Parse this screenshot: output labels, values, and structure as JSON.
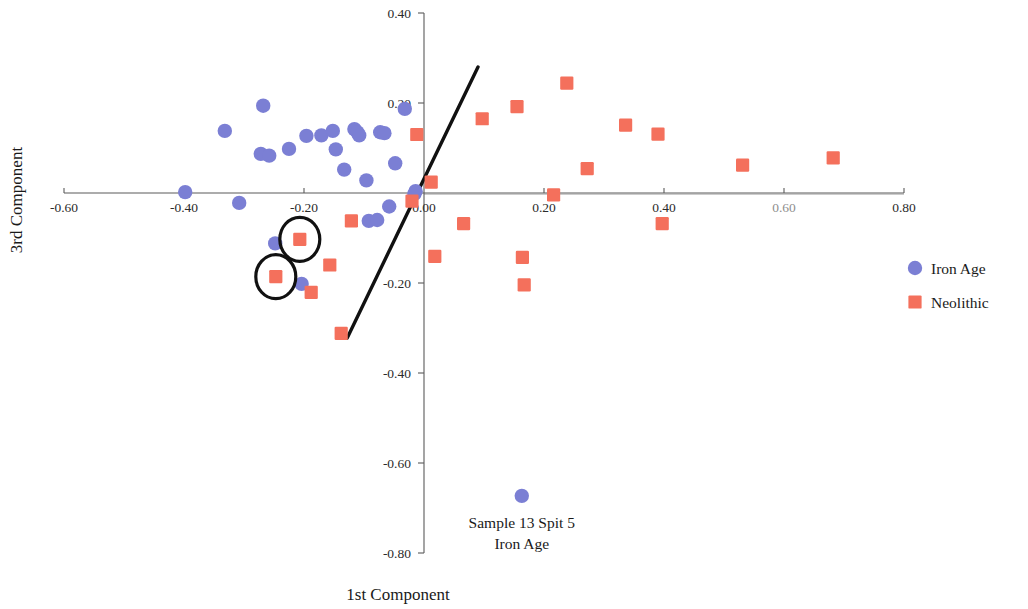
{
  "chart_data": {
    "type": "scatter",
    "title": "",
    "xlabel": "1st Component",
    "ylabel": "3rd Component",
    "xlim": [
      -0.6,
      0.8
    ],
    "ylim": [
      -0.8,
      0.4
    ],
    "grid": false,
    "legend_position": "right",
    "xticks": [
      -0.6,
      -0.4,
      -0.2,
      0.0,
      0.2,
      0.4,
      0.6,
      0.8
    ],
    "xticklabels": [
      "-0.60",
      "-0.40",
      "-0.20",
      "0.00",
      "0.20",
      "0.40",
      "0.60",
      "0.80"
    ],
    "yticks": [
      0.4,
      0.2,
      -0.2,
      -0.4,
      -0.6,
      -0.8
    ],
    "yticklabels": [
      "0.40",
      "0.20",
      "-0.20",
      "-0.40",
      "-0.60",
      "-0.80"
    ],
    "series": [
      {
        "name": "Iron Age",
        "marker": "circle",
        "color": "#7b7fd4",
        "points": [
          [
            -0.398,
            0.002
          ],
          [
            -0.332,
            0.138
          ],
          [
            -0.308,
            -0.022
          ],
          [
            -0.268,
            0.194
          ],
          [
            -0.272,
            0.087
          ],
          [
            -0.258,
            0.083
          ],
          [
            -0.248,
            -0.112
          ],
          [
            -0.225,
            0.098
          ],
          [
            -0.204,
            -0.202
          ],
          [
            -0.196,
            0.127
          ],
          [
            -0.171,
            0.128
          ],
          [
            -0.152,
            0.138
          ],
          [
            -0.147,
            0.097
          ],
          [
            -0.133,
            0.052
          ],
          [
            -0.116,
            0.142
          ],
          [
            -0.111,
            0.135
          ],
          [
            -0.108,
            0.128
          ],
          [
            -0.096,
            0.028
          ],
          [
            -0.092,
            -0.062
          ],
          [
            -0.078,
            -0.06
          ],
          [
            -0.073,
            0.135
          ],
          [
            -0.066,
            0.133
          ],
          [
            -0.058,
            -0.03
          ],
          [
            -0.048,
            0.066
          ],
          [
            -0.032,
            0.187
          ],
          [
            -0.016,
            -0.002
          ],
          [
            -0.014,
            0.004
          ],
          [
            0.163,
            -0.673
          ]
        ]
      },
      {
        "name": "Neolithic",
        "marker": "square",
        "color": "#f4705c",
        "points": [
          [
            -0.207,
            -0.103
          ],
          [
            -0.247,
            -0.186
          ],
          [
            -0.188,
            -0.221
          ],
          [
            -0.157,
            -0.16
          ],
          [
            -0.138,
            -0.312
          ],
          [
            -0.121,
            -0.062
          ],
          [
            -0.02,
            -0.018
          ],
          [
            -0.012,
            0.13
          ],
          [
            0.012,
            0.024
          ],
          [
            0.018,
            -0.141
          ],
          [
            0.066,
            -0.068
          ],
          [
            0.097,
            0.165
          ],
          [
            0.155,
            0.192
          ],
          [
            0.164,
            -0.143
          ],
          [
            0.167,
            -0.204
          ],
          [
            0.216,
            -0.004
          ],
          [
            0.238,
            0.244
          ],
          [
            0.272,
            0.054
          ],
          [
            0.336,
            0.151
          ],
          [
            0.39,
            0.131
          ],
          [
            0.397,
            -0.068
          ],
          [
            0.531,
            0.062
          ],
          [
            0.682,
            0.078
          ]
        ]
      }
    ],
    "trendline": {
      "x_start": -0.128,
      "y_start": -0.322,
      "x_end": 0.09,
      "y_end": 0.28,
      "color": "#111111"
    },
    "highlights": [
      {
        "x": -0.207,
        "y": -0.103,
        "shape": "ellipse",
        "rx": 20,
        "ry": 22
      },
      {
        "x": -0.247,
        "y": -0.186,
        "shape": "ellipse",
        "rx": 20,
        "ry": 22
      }
    ],
    "annotations": [
      {
        "lines": [
          "Sample 13 Spit 5",
          "Iron Age"
        ],
        "x": 0.163,
        "y": -0.673
      }
    ],
    "legend": [
      {
        "label": "Iron Age",
        "marker": "circle",
        "color": "#7b7fd4"
      },
      {
        "label": "Neolithic",
        "marker": "square",
        "color": "#f4705c"
      }
    ]
  },
  "faded_ticklabels": [
    "0.60"
  ]
}
